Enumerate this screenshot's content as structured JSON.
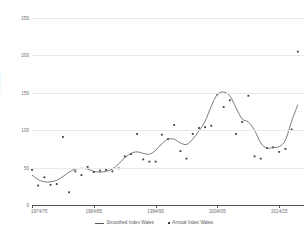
{
  "chart_data": {
    "type": "line",
    "title": "",
    "xlabel": "",
    "ylabel": "Width Index",
    "ylim": [
      0,
      250
    ],
    "yticks": [
      0,
      50,
      100,
      150,
      200,
      250
    ],
    "xticks": [
      "1974/75",
      "1984/85",
      "1994/95",
      "2004/05",
      "2014/15"
    ],
    "xtick_years": [
      1974,
      1984,
      1994,
      2004,
      2014
    ],
    "xlim": [
      1974,
      2018
    ],
    "grid": true,
    "legend_position": "bottom",
    "x": [
      1974,
      1975,
      1976,
      1977,
      1978,
      1979,
      1980,
      1981,
      1982,
      1983,
      1984,
      1985,
      1986,
      1987,
      1988,
      1989,
      1990,
      1991,
      1992,
      1993,
      1994,
      1995,
      1996,
      1997,
      1998,
      1999,
      2000,
      2001,
      2002,
      2003,
      2004,
      2005,
      2006,
      2007,
      2008,
      2009,
      2010,
      2011,
      2012,
      2013,
      2014,
      2015,
      2016,
      2017
    ],
    "series": [
      {
        "name": "Annual Index Wales",
        "style": "scatter",
        "marker": "square",
        "color": "#3c3c3e",
        "values": [
          47,
          26,
          37,
          27,
          28,
          91,
          17,
          45,
          40,
          51,
          44,
          46,
          47,
          45,
          49,
          65,
          68,
          95,
          61,
          58,
          58,
          94,
          88,
          107,
          72,
          62,
          95,
          103,
          104,
          106,
          148,
          131,
          140,
          95,
          111,
          146,
          65,
          62,
          76,
          77,
          71,
          75,
          101,
          205
        ]
      },
      {
        "name": "Smoothed Index Wales",
        "style": "line",
        "color": "#58595b",
        "values": [
          40,
          34,
          31,
          31,
          33,
          38,
          44,
          48,
          49,
          48,
          45,
          44,
          45,
          48,
          55,
          63,
          69,
          71,
          69,
          68,
          73,
          82,
          88,
          88,
          83,
          81,
          88,
          99,
          112,
          132,
          148,
          151,
          146,
          130,
          115,
          111,
          100,
          83,
          76,
          77,
          78,
          87,
          112,
          134
        ]
      }
    ]
  },
  "legend": {
    "items": [
      {
        "label": "Smoothed Index Wales",
        "type": "line"
      },
      {
        "label": "Annual Index Wales",
        "type": "marker"
      }
    ]
  }
}
